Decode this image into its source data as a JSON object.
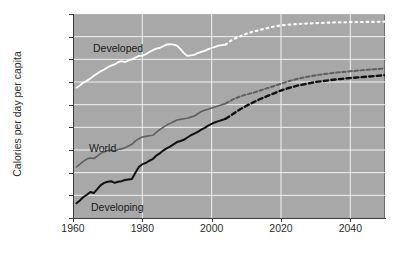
{
  "chart_data": {
    "type": "line",
    "title": "",
    "subtitle": "",
    "xlabel": "",
    "ylabel": "Calories per day per capita",
    "xlim": [
      1960,
      2050
    ],
    "ylim": [
      1800,
      3600
    ],
    "grid": true,
    "legend_position": "inline-annotations",
    "plot_background": "#a8a8a8",
    "gridline_color": "#f2f2f2",
    "x_ticks": [
      1960,
      1980,
      2000,
      2020,
      2040
    ],
    "x_tick_labels": [
      "1960",
      "1980",
      "2000",
      "2020",
      "2040"
    ],
    "y_ticks": [
      1800,
      2000,
      2200,
      2400,
      2600,
      2800,
      3000,
      3200,
      3400,
      3600
    ],
    "y_tick_labels": [
      "1,800",
      "2,000",
      "2,200",
      "2,400",
      "2,600",
      "2,800",
      "3,000",
      "3,200",
      "3,400",
      "3,600"
    ],
    "annotations": [
      {
        "name": "developed",
        "text": "Developed"
      },
      {
        "name": "world",
        "text": "World"
      },
      {
        "name": "developing",
        "text": "Developing"
      }
    ],
    "series": [
      {
        "name": "Developed",
        "color": "#ffffff",
        "width": 1.8,
        "historical_end_year": 2004,
        "projection_style": "dotted",
        "x": [
          1961,
          1962,
          1963,
          1964,
          1965,
          1966,
          1967,
          1968,
          1969,
          1970,
          1971,
          1972,
          1973,
          1974,
          1975,
          1976,
          1977,
          1978,
          1979,
          1980,
          1981,
          1982,
          1983,
          1984,
          1985,
          1986,
          1987,
          1988,
          1989,
          1990,
          1991,
          1992,
          1993,
          1994,
          1995,
          1996,
          1997,
          1998,
          1999,
          2000,
          2001,
          2002,
          2003,
          2004,
          2006,
          2008,
          2010,
          2012,
          2014,
          2016,
          2018,
          2020,
          2022,
          2025,
          2030,
          2035,
          2040,
          2045,
          2050
        ],
        "y": [
          2950,
          2970,
          2995,
          3010,
          3030,
          3055,
          3075,
          3095,
          3110,
          3130,
          3145,
          3155,
          3175,
          3185,
          3175,
          3190,
          3200,
          3215,
          3230,
          3230,
          3245,
          3265,
          3280,
          3295,
          3300,
          3315,
          3330,
          3335,
          3330,
          3320,
          3290,
          3255,
          3230,
          3235,
          3240,
          3255,
          3265,
          3275,
          3290,
          3300,
          3310,
          3320,
          3325,
          3330,
          3375,
          3400,
          3425,
          3445,
          3460,
          3475,
          3490,
          3500,
          3505,
          3512,
          3520,
          3525,
          3528,
          3530,
          3532
        ]
      },
      {
        "name": "World",
        "color": "#5f5f5f",
        "width": 1.6,
        "historical_end_year": 2004,
        "projection_style": "dashed",
        "x": [
          1961,
          1962,
          1963,
          1964,
          1965,
          1966,
          1967,
          1968,
          1969,
          1970,
          1971,
          1972,
          1973,
          1974,
          1975,
          1976,
          1977,
          1978,
          1979,
          1980,
          1981,
          1982,
          1983,
          1984,
          1985,
          1986,
          1987,
          1988,
          1989,
          1990,
          1991,
          1992,
          1993,
          1994,
          1995,
          1996,
          1997,
          1998,
          1999,
          2000,
          2001,
          2002,
          2003,
          2004,
          2006,
          2008,
          2010,
          2012,
          2014,
          2016,
          2018,
          2020,
          2022,
          2025,
          2030,
          2035,
          2040,
          2045,
          2050
        ],
        "y": [
          2250,
          2275,
          2300,
          2320,
          2330,
          2325,
          2345,
          2370,
          2385,
          2395,
          2400,
          2390,
          2405,
          2410,
          2420,
          2435,
          2450,
          2480,
          2500,
          2515,
          2520,
          2525,
          2530,
          2555,
          2580,
          2600,
          2620,
          2635,
          2650,
          2665,
          2670,
          2675,
          2680,
          2690,
          2700,
          2720,
          2740,
          2750,
          2760,
          2770,
          2780,
          2790,
          2800,
          2810,
          2845,
          2870,
          2890,
          2905,
          2925,
          2945,
          2965,
          2985,
          3005,
          3030,
          3060,
          3080,
          3095,
          3108,
          3120
        ]
      },
      {
        "name": "Developing",
        "color": "#111111",
        "width": 2.0,
        "historical_end_year": 2004,
        "projection_style": "dashed",
        "x": [
          1961,
          1962,
          1963,
          1964,
          1965,
          1966,
          1967,
          1968,
          1969,
          1970,
          1971,
          1972,
          1973,
          1974,
          1975,
          1976,
          1977,
          1978,
          1979,
          1980,
          1981,
          1982,
          1983,
          1984,
          1985,
          1986,
          1987,
          1988,
          1989,
          1990,
          1991,
          1992,
          1993,
          1994,
          1995,
          1996,
          1997,
          1998,
          1999,
          2000,
          2001,
          2002,
          2003,
          2004,
          2006,
          2008,
          2010,
          2012,
          2014,
          2016,
          2018,
          2020,
          2022,
          2025,
          2030,
          2035,
          2040,
          2045,
          2050
        ],
        "y": [
          1930,
          1955,
          1985,
          2005,
          2030,
          2020,
          2055,
          2090,
          2110,
          2120,
          2125,
          2110,
          2120,
          2125,
          2135,
          2140,
          2145,
          2200,
          2250,
          2275,
          2285,
          2305,
          2320,
          2350,
          2370,
          2395,
          2415,
          2430,
          2450,
          2470,
          2480,
          2490,
          2510,
          2530,
          2545,
          2560,
          2580,
          2595,
          2615,
          2630,
          2645,
          2655,
          2665,
          2675,
          2715,
          2755,
          2790,
          2820,
          2850,
          2875,
          2900,
          2925,
          2945,
          2970,
          3000,
          3020,
          3035,
          3048,
          3060
        ]
      }
    ]
  }
}
